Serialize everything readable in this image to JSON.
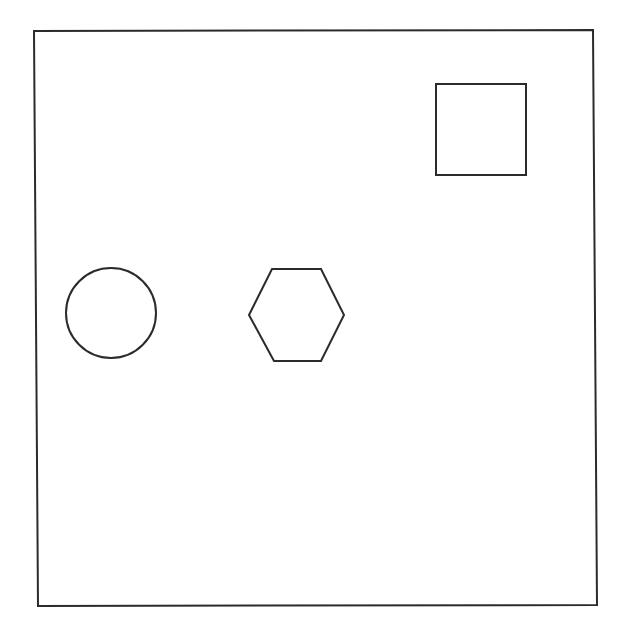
{
  "diagram": {
    "background": "#ffffff",
    "stroke_color": "#2b2b2b",
    "frame": {
      "label": "frame",
      "points": [
        [
          34,
          31
        ],
        [
          593,
          30
        ],
        [
          597,
          605
        ],
        [
          38,
          606
        ]
      ],
      "stroke_width": 2
    },
    "shapes": [
      {
        "type": "circle",
        "label": "circle",
        "cx": 111,
        "cy": 313,
        "r": 45,
        "stroke_width": 2
      },
      {
        "type": "hexagon",
        "label": "hexagon",
        "points": [
          [
            272,
            269
          ],
          [
            321,
            269
          ],
          [
            344,
            315
          ],
          [
            321,
            361
          ],
          [
            274,
            361
          ],
          [
            249,
            315
          ]
        ],
        "stroke_width": 2
      },
      {
        "type": "square",
        "label": "square",
        "x": 436,
        "y": 84,
        "width": 90,
        "height": 91,
        "stroke_width": 2
      }
    ]
  }
}
